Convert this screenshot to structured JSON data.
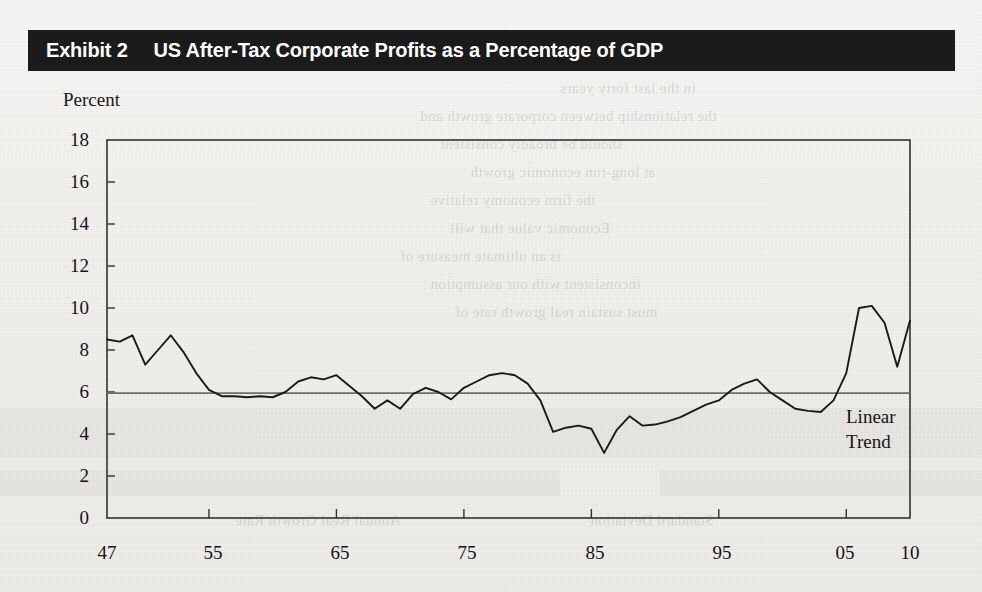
{
  "header": {
    "exhibit_number": "Exhibit 2",
    "title": "US After-Tax Corporate Profits as a Percentage of GDP",
    "bar_color": "#1b1b1b",
    "text_color": "#ffffff"
  },
  "labels": {
    "axis_title": "Percent",
    "trend_line_1": "Linear",
    "trend_line_2": "Trend"
  },
  "chart_data": {
    "type": "line",
    "title": "US After-Tax Corporate Profits as a Percentage of GDP",
    "xlabel": "",
    "ylabel": "Percent",
    "ylim": [
      0,
      18
    ],
    "xlim": [
      1947,
      2010
    ],
    "ytick_labels": [
      "18",
      "16",
      "14",
      "12",
      "10",
      "8",
      "6",
      "4",
      "2",
      "0"
    ],
    "yticks": [
      18,
      16,
      14,
      12,
      10,
      8,
      6,
      4,
      2,
      0
    ],
    "xtick_labels": [
      "47",
      "55",
      "65",
      "75",
      "85",
      "95",
      "05",
      "10"
    ],
    "xticks": [
      1947,
      1955,
      1965,
      1975,
      1985,
      1995,
      2005,
      2010
    ],
    "grid": false,
    "legend": false,
    "line_color": "#1a1a1a",
    "trend_color": "#6e6e6e",
    "series": [
      {
        "name": "US After-Tax Corporate Profits as a Percentage of GDP",
        "x": [
          1947,
          1948,
          1949,
          1950,
          1951,
          1952,
          1953,
          1954,
          1955,
          1956,
          1957,
          1958,
          1959,
          1960,
          1961,
          1962,
          1963,
          1964,
          1965,
          1966,
          1967,
          1968,
          1969,
          1970,
          1971,
          1972,
          1973,
          1974,
          1975,
          1976,
          1977,
          1978,
          1979,
          1980,
          1981,
          1982,
          1983,
          1984,
          1985,
          1986,
          1987,
          1988,
          1989,
          1990,
          1991,
          1992,
          1993,
          1994,
          1995,
          1996,
          1997,
          1998,
          1999,
          2000,
          2001,
          2002,
          2003,
          2004,
          2005,
          2006,
          2007,
          2008,
          2009,
          2010
        ],
        "values": [
          8.5,
          8.4,
          8.7,
          7.3,
          8.0,
          8.7,
          7.9,
          6.9,
          6.1,
          5.8,
          5.8,
          5.75,
          5.8,
          5.75,
          6.0,
          6.5,
          6.7,
          6.6,
          6.8,
          6.3,
          5.8,
          5.2,
          5.6,
          5.2,
          5.9,
          6.2,
          6.0,
          5.65,
          6.2,
          6.5,
          6.8,
          6.9,
          6.8,
          6.4,
          5.6,
          4.1,
          4.3,
          4.4,
          4.25,
          3.1,
          4.2,
          4.85,
          4.4,
          4.45,
          4.6,
          4.8,
          5.1,
          5.4,
          5.6,
          6.1,
          6.4,
          6.6,
          6.0,
          5.6,
          5.2,
          5.1,
          5.05,
          5.6,
          6.9,
          10.0,
          10.1,
          9.3,
          7.2,
          9.4
        ]
      }
    ],
    "trend_line": {
      "name": "Linear Trend",
      "x": [
        1947,
        2010
      ],
      "values": [
        5.95,
        5.95
      ]
    }
  },
  "bleed_through": [
    "in the last forty years",
    "the relationship between corporate growth and",
    "should be broadly consistent",
    "at long-run economic growth",
    "the firm economy relative",
    "Economic value that will",
    "is an ultimate measure of",
    "inconsistent with our assumption",
    "must sustain real growth rate of",
    "Annual Real Growth Rate",
    "Standard Deviation"
  ]
}
